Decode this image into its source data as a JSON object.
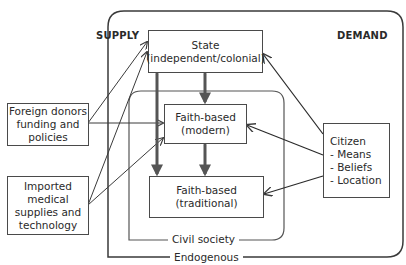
{
  "diagram": {
    "headings": {
      "supply": "SUPPLY",
      "demand": "DEMAND"
    },
    "containers": {
      "endogenous": "Endogenous",
      "civil_society": "Civil society"
    },
    "nodes": {
      "state": {
        "line1": "State",
        "line2": "(independent/colonial)"
      },
      "faith_modern": {
        "line1": "Faith-based",
        "line2": "(modern)"
      },
      "faith_traditional": {
        "line1": "Faith-based",
        "line2": "(traditional)"
      },
      "foreign_donors": {
        "line1": "Foreign donors",
        "line2": "funding and",
        "line3": "policies"
      },
      "imported": {
        "line1": "Imported",
        "line2": "medical",
        "line3": "supplies and",
        "line4": "technology"
      },
      "citizen": {
        "line1": "Citizen",
        "line2": "- Means",
        "line3": "- Beliefs",
        "line4": "- Location"
      }
    },
    "edges": [
      {
        "from": "foreign_donors",
        "to": "state",
        "type": "arrow"
      },
      {
        "from": "foreign_donors",
        "to": "faith_modern",
        "type": "arrow"
      },
      {
        "from": "imported",
        "to": "state",
        "type": "arrow"
      },
      {
        "from": "imported",
        "to": "faith_modern",
        "type": "arrow"
      },
      {
        "from": "citizen",
        "to": "state",
        "type": "arrow"
      },
      {
        "from": "citizen",
        "to": "faith_modern",
        "type": "arrow"
      },
      {
        "from": "citizen",
        "to": "faith_traditional",
        "type": "arrow"
      },
      {
        "from": "state",
        "to": "faith_modern",
        "type": "bidirectional-thick"
      },
      {
        "from": "faith_modern",
        "to": "faith_traditional",
        "type": "bidirectional-thick"
      },
      {
        "from": "state",
        "to": "faith_traditional",
        "type": "bidirectional-thick"
      }
    ]
  }
}
